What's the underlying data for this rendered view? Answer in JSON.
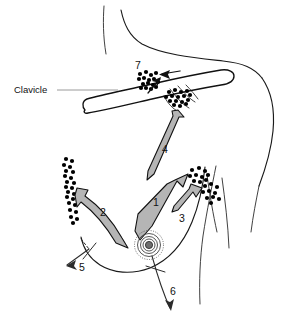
{
  "figure": {
    "background_color": "#ffffff",
    "line_color": "#1a1a1a",
    "arrow_fill_color": "#b5b5b5",
    "node_color": "#000000",
    "leader_color": "#9a9a9a"
  },
  "labels": {
    "clavicle": "Clavicle",
    "pathway_1": "1",
    "pathway_2": "2",
    "pathway_3": "3",
    "pathway_4": "4",
    "pathway_5": "5",
    "pathway_6": "6",
    "pathway_7": "7"
  },
  "label_positions": {
    "clavicle": {
      "x": 14,
      "y": 90
    },
    "pathway_1": {
      "x": 156,
      "y": 203
    },
    "pathway_2": {
      "x": 103,
      "y": 213
    },
    "pathway_3": {
      "x": 182,
      "y": 219
    },
    "pathway_4": {
      "x": 165,
      "y": 150
    },
    "pathway_5": {
      "x": 82,
      "y": 268
    },
    "pathway_6": {
      "x": 173,
      "y": 292
    },
    "pathway_7": {
      "x": 138,
      "y": 66
    }
  },
  "node_clusters": [
    {
      "name": "supraclavicular-node-cluster",
      "dots": [
        [
          140,
          74
        ],
        [
          146,
          72
        ],
        [
          151,
          75
        ],
        [
          156,
          73
        ],
        [
          139,
          79
        ],
        [
          144,
          78
        ],
        [
          149,
          80
        ],
        [
          154,
          79
        ],
        [
          143,
          84
        ],
        [
          148,
          83
        ],
        [
          153,
          85
        ],
        [
          158,
          82
        ],
        [
          146,
          88
        ],
        [
          151,
          89
        ],
        [
          156,
          87
        ],
        [
          141,
          88
        ]
      ]
    },
    {
      "name": "infraclavicular-node-cluster",
      "dots": [
        [
          169,
          92
        ],
        [
          175,
          90
        ],
        [
          181,
          92
        ],
        [
          187,
          91
        ],
        [
          166,
          97
        ],
        [
          172,
          96
        ],
        [
          178,
          97
        ],
        [
          184,
          96
        ],
        [
          190,
          95
        ],
        [
          170,
          101
        ],
        [
          176,
          101
        ],
        [
          182,
          102
        ],
        [
          188,
          100
        ],
        [
          174,
          105
        ],
        [
          180,
          106
        ],
        [
          186,
          104
        ]
      ]
    },
    {
      "name": "internal-mammary-node-chain",
      "dots": [
        [
          66,
          159
        ],
        [
          72,
          161
        ],
        [
          64,
          165
        ],
        [
          70,
          167
        ],
        [
          66,
          171
        ],
        [
          73,
          172
        ],
        [
          65,
          176
        ],
        [
          71,
          178
        ],
        [
          67,
          182
        ],
        [
          74,
          183
        ],
        [
          66,
          187
        ],
        [
          72,
          188
        ],
        [
          68,
          192
        ],
        [
          74,
          194
        ],
        [
          67,
          197
        ],
        [
          73,
          199
        ],
        [
          69,
          203
        ],
        [
          75,
          205
        ],
        [
          70,
          210
        ],
        [
          76,
          212
        ],
        [
          71,
          217
        ],
        [
          77,
          219
        ],
        [
          73,
          223
        ]
      ]
    },
    {
      "name": "axillary-node-cluster-upper",
      "dots": [
        [
          192,
          170
        ],
        [
          199,
          168
        ],
        [
          205,
          171
        ],
        [
          190,
          176
        ],
        [
          196,
          175
        ],
        [
          202,
          177
        ],
        [
          208,
          175
        ],
        [
          194,
          181
        ],
        [
          200,
          182
        ],
        [
          206,
          180
        ]
      ]
    },
    {
      "name": "axillary-node-cluster-lower",
      "dots": [
        [
          205,
          186
        ],
        [
          211,
          184
        ],
        [
          217,
          187
        ],
        [
          203,
          192
        ],
        [
          209,
          191
        ],
        [
          215,
          193
        ],
        [
          207,
          198
        ],
        [
          213,
          197
        ],
        [
          219,
          199
        ],
        [
          211,
          203
        ]
      ]
    }
  ]
}
